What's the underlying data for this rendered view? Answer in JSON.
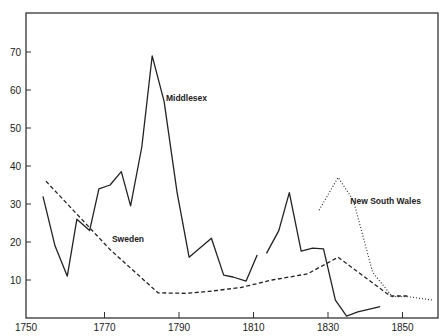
{
  "chart_data": {
    "type": "line",
    "title": "",
    "xlabel": "",
    "ylabel": "",
    "xlim": [
      1750,
      1860
    ],
    "ylim": [
      0,
      78
    ],
    "grid": false,
    "legend": "inline labels",
    "x_ticks": [
      1750,
      1770,
      1790,
      1810,
      1830,
      1850
    ],
    "y_ticks": [
      10,
      20,
      30,
      40,
      50,
      60,
      70
    ],
    "series": [
      {
        "name": "Middlesex",
        "style": "solid",
        "label_pos": [
          1786.5,
          57
        ],
        "segments": [
          [
            [
              1753.5,
              32
            ],
            [
              1756.7,
              19
            ],
            [
              1760,
              11
            ],
            [
              1762.6,
              26
            ],
            [
              1766,
              23
            ],
            [
              1768.5,
              34
            ],
            [
              1771.5,
              35
            ],
            [
              1774.5,
              38.5
            ],
            [
              1777,
              29.5
            ],
            [
              1780,
              45
            ],
            [
              1782.8,
              69
            ],
            [
              1786,
              57
            ],
            [
              1789.5,
              33
            ],
            [
              1792.7,
              16
            ],
            [
              1798.7,
              21
            ],
            [
              1802,
              11.3
            ],
            [
              1804.5,
              10.8
            ],
            [
              1808,
              9.7
            ],
            [
              1811,
              16.6
            ]
          ],
          [
            [
              1813.5,
              17
            ],
            [
              1816.8,
              23
            ],
            [
              1819.6,
              33
            ],
            [
              1822.8,
              17.6
            ],
            [
              1825.9,
              18.4
            ],
            [
              1828.8,
              18.2
            ],
            [
              1832,
              4.7
            ],
            [
              1835,
              0.5
            ],
            [
              1838,
              1.6
            ],
            [
              1844,
              3
            ]
          ]
        ]
      },
      {
        "name": "Sweden",
        "style": "dashed",
        "label_pos": [
          1772,
          20
        ],
        "segments": [
          [
            [
              1754.3,
              36
            ],
            [
              1771.5,
              18
            ],
            [
              1784.4,
              6.6
            ],
            [
              1792,
              6.5
            ],
            [
              1798,
              7
            ],
            [
              1806.5,
              8
            ],
            [
              1815,
              10
            ],
            [
              1824.5,
              11.6
            ],
            [
              1832.7,
              16
            ],
            [
              1846.7,
              5.8
            ],
            [
              1852,
              5.8
            ]
          ]
        ]
      },
      {
        "name": "New South Wales",
        "style": "dotted",
        "label_pos": [
          1836,
          30
        ],
        "segments": [
          [
            [
              1827.6,
              28.4
            ],
            [
              1832.7,
              37
            ],
            [
              1836.8,
              31
            ],
            [
              1842,
              12
            ],
            [
              1847.3,
              5.6
            ],
            [
              1851.6,
              5.6
            ],
            [
              1858,
              4.7
            ]
          ]
        ]
      }
    ]
  }
}
